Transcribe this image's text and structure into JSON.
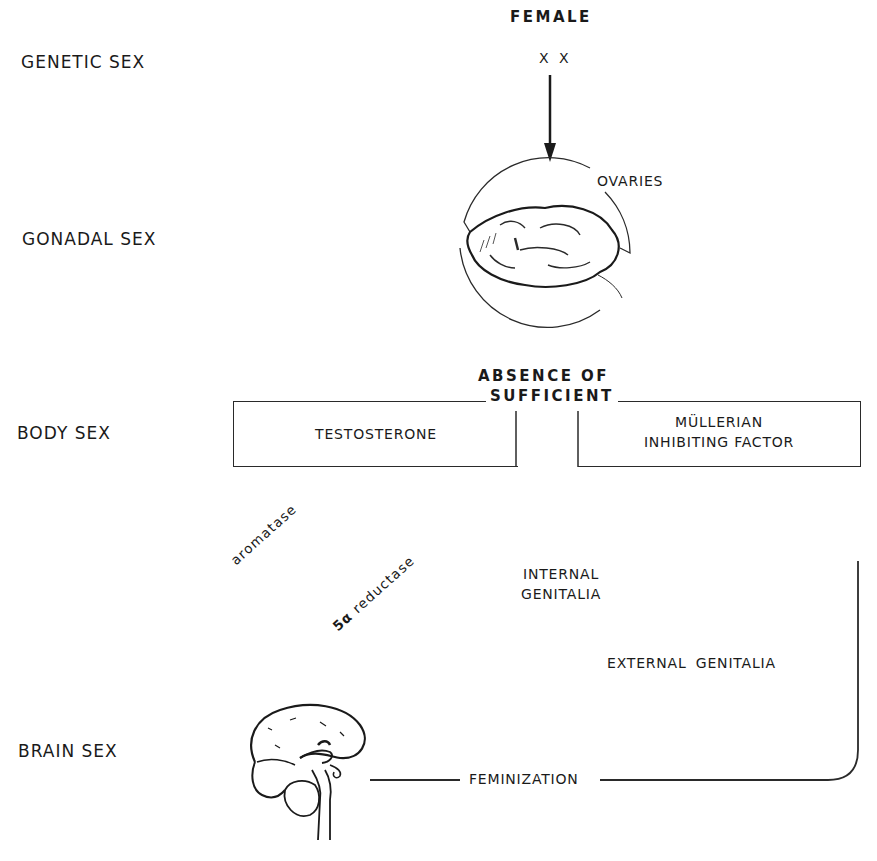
{
  "row_labels": {
    "genetic": "GENETIC SEX",
    "gonadal": "GONADAL SEX",
    "body": "BODY SEX",
    "brain": "BRAIN SEX"
  },
  "header": {
    "sex": "FEMALE",
    "chromosomes": "X X"
  },
  "gonad": {
    "label": "OVARIES",
    "icon": "ovary-illustration"
  },
  "hormones": {
    "absence_line1": "ABSENCE OF",
    "absence_line2": "SUFFICIENT",
    "box_left": "TESTOSTERONE",
    "box_right_line1": "MÜLLERIAN",
    "box_right_line2": "INHIBITING FACTOR"
  },
  "enzymes": {
    "aromatase": "aromatase",
    "reductase_prefix": "5α",
    "reductase": "reductase"
  },
  "outcomes": {
    "internal_line1": "INTERNAL",
    "internal_line2": "GENITALIA",
    "external": "EXTERNAL GENITALIA",
    "brain_effect": "FEMINIZATION"
  },
  "brain": {
    "icon": "brain-illustration"
  },
  "colors": {
    "ink": "#1a1a1a",
    "background": "#ffffff"
  }
}
